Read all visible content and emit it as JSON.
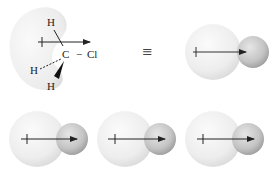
{
  "diagram": {
    "structure": {
      "atoms": {
        "h_top": "H",
        "carbon": "C",
        "bond_cl": "−",
        "chlorine": "Cl",
        "h_left": "H",
        "h_bottom": "H"
      },
      "equivalence_symbol": "≡"
    },
    "models": [
      {
        "id": "model-top-right",
        "large_sphere_color": "#e8e8e8",
        "small_sphere_color": "#c8c8c8",
        "arrow": "dipole-arrow"
      },
      {
        "id": "model-bottom-1",
        "large_sphere_color": "#e8e8e8",
        "small_sphere_color": "#c8c8c8",
        "arrow": "dipole-arrow"
      },
      {
        "id": "model-bottom-2",
        "large_sphere_color": "#e8e8e8",
        "small_sphere_color": "#c8c8c8",
        "arrow": "dipole-arrow"
      },
      {
        "id": "model-bottom-3",
        "large_sphere_color": "#e8e8e8",
        "small_sphere_color": "#c8c8c8",
        "arrow": "dipole-arrow"
      }
    ],
    "colors": {
      "arrow": "#222222",
      "electron_cloud": "#efefef"
    }
  }
}
